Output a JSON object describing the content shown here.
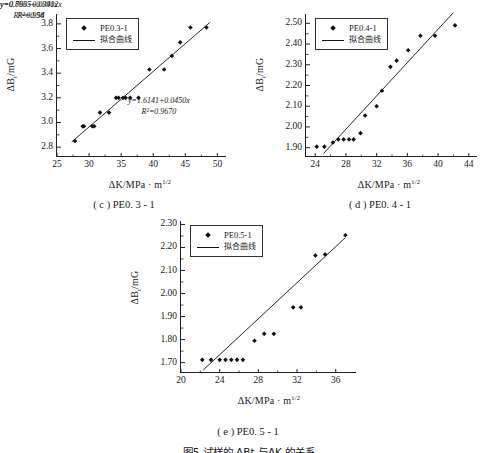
{
  "figure": {
    "caption": "图5  试样的 ΔBt 与ΔK 的关系"
  },
  "panels": [
    {
      "id": "c",
      "caption": "( c ) PE0. 3 - 1",
      "legend": {
        "marker_label": "PE0.3-1",
        "line_label": "拟合曲线"
      },
      "equation": "y=1.6141+0.0450x",
      "r2": "R²=0.9670",
      "xlabel_head": "ΔK/MPa",
      "xlabel_unit": "m",
      "xlabel_exp": "1/2",
      "ylabel_head": "ΔB",
      "ylabel_sub": "t",
      "ylabel_unit": "/mG",
      "chart_data": {
        "type": "scatter",
        "title": "( c ) PE0. 3 - 1",
        "xlabel": "ΔK/MPa·m^(1/2)",
        "ylabel": "ΔBt/mG",
        "xlim": [
          25,
          51.5
        ],
        "ylim": [
          2.72,
          3.88
        ],
        "xticks": [
          25,
          30,
          35,
          40,
          45,
          50
        ],
        "yticks": [
          2.8,
          3.0,
          3.2,
          3.4,
          3.6,
          3.8
        ],
        "grid": false,
        "legend_position": "top-left",
        "series": [
          {
            "name": "PE0.3-1",
            "marker": "diamond",
            "x": [
              27.8,
              29.0,
              29.2,
              30.5,
              30.8,
              31.7,
              33.1,
              34.2,
              34.6,
              35.3,
              35.7,
              36.4,
              37.7,
              39.4,
              41.7,
              42.9,
              44.2,
              45.8,
              48.3
            ],
            "y": [
              2.85,
              2.97,
              2.97,
              2.97,
              2.97,
              3.08,
              3.08,
              3.2,
              3.2,
              3.2,
              3.2,
              3.2,
              3.2,
              3.43,
              3.43,
              3.54,
              3.65,
              3.77,
              3.77
            ]
          },
          {
            "name": "拟合曲线",
            "type": "line",
            "slope": 0.045,
            "intercept": 1.6141,
            "r_squared": 0.967,
            "x_range": [
              27.3,
              48.8
            ]
          }
        ]
      }
    },
    {
      "id": "d",
      "caption": "( d ) PE0. 4 - 1",
      "legend": {
        "marker_label": "PE0.4-1",
        "line_label": "拟合曲线"
      },
      "equation": "y=0.8635+0.0402x",
      "r2": "R²=0.94",
      "xlabel_head": "ΔK/MPa",
      "xlabel_unit": "m",
      "xlabel_exp": "1/2",
      "ylabel_head": "ΔB",
      "ylabel_sub": "t",
      "ylabel_unit": "/mG",
      "chart_data": {
        "type": "scatter",
        "title": "( d ) PE0. 4 - 1",
        "xlabel": "ΔK/MPa·m^(1/2)",
        "ylabel": "ΔBt/mG",
        "xlim": [
          22.8,
          45.2
        ],
        "ylim": [
          1.855,
          2.545
        ],
        "xticks": [
          24,
          28,
          32,
          36,
          40,
          44
        ],
        "yticks": [
          1.9,
          2.0,
          2.1,
          2.2,
          2.3,
          2.4,
          2.5
        ],
        "grid": false,
        "legend_position": "top-left",
        "series": [
          {
            "name": "PE0.4-1",
            "marker": "diamond",
            "x": [
              24.2,
              25.2,
              26.3,
              27.0,
              27.7,
              28.4,
              29.0,
              29.9,
              30.5,
              32.0,
              32.7,
              33.8,
              34.6,
              36.1,
              37.7,
              39.6,
              42.2
            ],
            "y": [
              1.905,
              1.905,
              1.925,
              1.94,
              1.94,
              1.94,
              1.94,
              1.97,
              2.055,
              2.1,
              2.175,
              2.29,
              2.32,
              2.37,
              2.44,
              2.44,
              2.49
            ]
          },
          {
            "name": "拟合曲线",
            "type": "line",
            "slope": 0.0402,
            "intercept": 0.8635,
            "r_squared": 0.94,
            "x_range": [
              25.1,
              42.0
            ]
          }
        ]
      }
    },
    {
      "id": "e",
      "caption": "( e ) PE0. 5 - 1",
      "legend": {
        "marker_label": "PE0.5-1",
        "line_label": "拟合曲线"
      },
      "equation": "y=0.796+0.0391x",
      "r2": "R²=0.958",
      "xlabel_head": "ΔK/MPa",
      "xlabel_unit": "m",
      "xlabel_exp": "1/2",
      "ylabel_head": "ΔB",
      "ylabel_sub": "t",
      "ylabel_unit": "/mG",
      "chart_data": {
        "type": "scatter",
        "title": "( e ) PE0. 5 - 1",
        "xlabel": "ΔK/MPa·m^(1/2)",
        "ylabel": "ΔBt/mG",
        "xlim": [
          20,
          38.2
        ],
        "ylim": [
          1.655,
          2.315
        ],
        "xticks": [
          20,
          24,
          28,
          32,
          36
        ],
        "yticks": [
          1.7,
          1.8,
          1.9,
          2.0,
          2.1,
          2.2,
          2.3
        ],
        "grid": false,
        "legend_position": "top-left",
        "series": [
          {
            "name": "PE0.5-1",
            "marker": "diamond",
            "x": [
              22.2,
              23.1,
              24.0,
              24.6,
              25.2,
              25.8,
              26.4,
              27.6,
              28.6,
              29.6,
              31.6,
              32.4,
              33.9,
              34.9,
              37.0
            ],
            "y": [
              1.712,
              1.712,
              1.712,
              1.712,
              1.712,
              1.712,
              1.712,
              1.795,
              1.825,
              1.825,
              1.94,
              1.94,
              2.165,
              2.17,
              2.253
            ]
          },
          {
            "name": "拟合曲线",
            "type": "line",
            "slope": 0.0391,
            "intercept": 0.796,
            "r_squared": 0.958,
            "x_range": [
              22.3,
              37.0
            ]
          }
        ]
      }
    }
  ]
}
